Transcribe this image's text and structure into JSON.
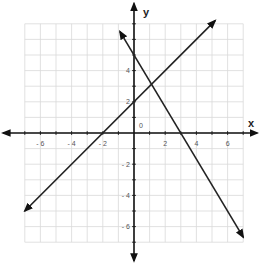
{
  "chart_data": {
    "type": "line",
    "title": "",
    "xlabel": "x",
    "ylabel": "y",
    "xlim": [
      -7,
      7
    ],
    "ylim": [
      -7,
      7
    ],
    "grid": true,
    "x_ticks": [
      -6,
      -4,
      -2,
      2,
      4,
      6
    ],
    "y_ticks": [
      -6,
      -4,
      -2,
      2,
      4
    ],
    "origin_label": "0",
    "series": [
      {
        "name": "line-1",
        "equation": "y = x + 2",
        "slope": 1,
        "intercept": 2,
        "x": [
          -7,
          5.2
        ],
        "y": [
          -5,
          7.2
        ],
        "x_intercept": -2,
        "y_intercept": 2
      },
      {
        "name": "line-2",
        "equation": "y = -5/3 x + 5",
        "slope": -1.667,
        "intercept": 5,
        "x": [
          -0.9,
          7
        ],
        "y": [
          6.5,
          -6.67
        ],
        "x_intercept": 3,
        "y_intercept": 5
      }
    ],
    "intersection": {
      "x": 1.125,
      "y": 3.125
    }
  },
  "labels": {
    "x_axis": "x",
    "y_axis": "y",
    "origin": "0"
  },
  "colors": {
    "line": "#222222",
    "grid": "#d9d9d9",
    "axis": "#111111"
  }
}
